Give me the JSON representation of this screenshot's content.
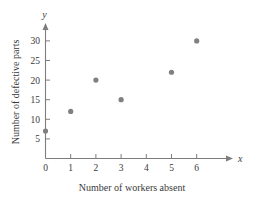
{
  "chart_data": {
    "type": "scatter",
    "title": "",
    "subtitle": "",
    "xlabel": "Number of workers absent",
    "ylabel": "Number of defective parts",
    "x_axis_variable": "x",
    "y_axis_variable": "y",
    "xlim": [
      0,
      7
    ],
    "ylim": [
      0,
      33
    ],
    "grid": false,
    "legend": null,
    "marker_color": "#808080",
    "axis_color": "#7d7d7d",
    "background_color": "#ffffff",
    "x_ticks": [
      "0",
      "1",
      "2",
      "3",
      "4",
      "5",
      "6"
    ],
    "y_ticks": [
      "5",
      "10",
      "15",
      "20",
      "25",
      "30"
    ],
    "points": [
      {
        "x": 0,
        "y": 7
      },
      {
        "x": 1,
        "y": 12
      },
      {
        "x": 2,
        "y": 20
      },
      {
        "x": 3,
        "y": 15
      },
      {
        "x": 5,
        "y": 22
      },
      {
        "x": 6,
        "y": 30
      }
    ],
    "x": [
      0,
      1,
      2,
      3,
      5,
      6
    ],
    "values": [
      7,
      12,
      20,
      15,
      22,
      30
    ]
  }
}
